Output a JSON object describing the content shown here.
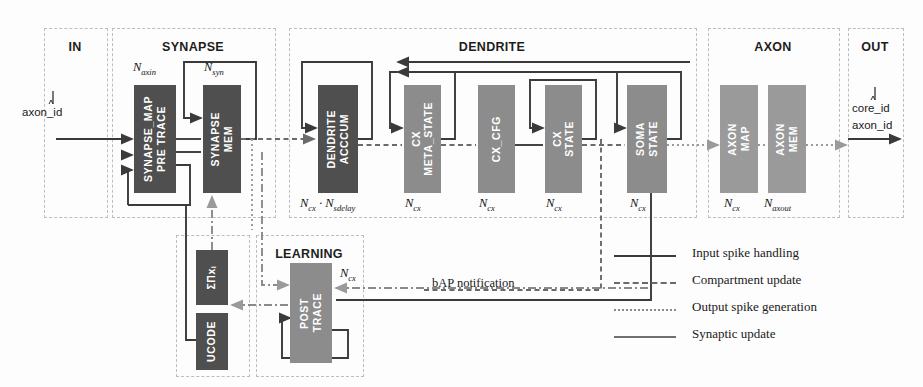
{
  "diagram": {
    "groups": [
      {
        "id": "in",
        "label": "IN",
        "x": 44,
        "y": 28,
        "w": 62,
        "h": 188
      },
      {
        "id": "synapse",
        "label": "SYNAPSE",
        "x": 112,
        "y": 28,
        "w": 162,
        "h": 188
      },
      {
        "id": "dendrite",
        "label": "DENDRITE",
        "x": 289,
        "y": 28,
        "w": 406,
        "h": 188
      },
      {
        "id": "axon",
        "label": "AXON",
        "x": 708,
        "y": 28,
        "w": 130,
        "h": 188
      },
      {
        "id": "out",
        "label": "OUT",
        "x": 848,
        "y": 28,
        "w": 54,
        "h": 188
      },
      {
        "id": "learnbox",
        "label": "",
        "x": 176,
        "y": 235,
        "w": 72,
        "h": 140
      },
      {
        "id": "learning",
        "label": "LEARNING",
        "x": 256,
        "y": 235,
        "w": 106,
        "h": 140
      }
    ],
    "blocks": [
      {
        "id": "synapse-map-pre-trace",
        "lines": [
          "SYNAPSE_MAP",
          "PRE TRACE"
        ],
        "shade": "dark",
        "x": 134,
        "y": 85,
        "w": 42,
        "h": 108,
        "caption": "N",
        "caption_sub": "axin",
        "caption_x": 133,
        "caption_y": 66
      },
      {
        "id": "synapse-mem",
        "lines": [
          "SYNAPSE",
          "MEM"
        ],
        "shade": "dark",
        "x": 203,
        "y": 85,
        "w": 38,
        "h": 108,
        "caption": "N",
        "caption_sub": "syn",
        "caption_x": 203,
        "caption_y": 66
      },
      {
        "id": "dendrite-acccum",
        "lines": [
          "DENDRITE",
          "ACCCUM"
        ],
        "shade": "dark",
        "x": 318,
        "y": 85,
        "w": 40,
        "h": 108,
        "caption": "N",
        "caption_sub": "cx",
        "caption_x": 303,
        "caption_y": 196,
        "caption2": "N",
        "caption2_sub": "sdelay",
        "caption_dot": " · "
      },
      {
        "id": "cx-meta-state",
        "lines": [
          "CX",
          "META_STATE"
        ],
        "shade": "mid",
        "x": 404,
        "y": 85,
        "w": 37,
        "h": 108,
        "caption": "N",
        "caption_sub": "cx",
        "caption_x": 404,
        "caption_y": 196
      },
      {
        "id": "cx-cfg",
        "lines": [
          "CX_CFG"
        ],
        "shade": "mid",
        "x": 478,
        "y": 85,
        "w": 37,
        "h": 108,
        "caption": "N",
        "caption_sub": "cx",
        "caption_x": 478,
        "caption_y": 196
      },
      {
        "id": "cx-state",
        "lines": [
          "CX",
          "STATE"
        ],
        "shade": "mid",
        "x": 545,
        "y": 85,
        "w": 37,
        "h": 108,
        "caption": "N",
        "caption_sub": "cx",
        "caption_x": 545,
        "caption_y": 196
      },
      {
        "id": "soma-state",
        "lines": [
          "SOMA",
          "STATE"
        ],
        "shade": "mid",
        "x": 627,
        "y": 85,
        "w": 40,
        "h": 108,
        "caption": "N",
        "caption_sub": "cx",
        "caption_x": 628,
        "caption_y": 196
      },
      {
        "id": "axon-map",
        "lines": [
          "AXON",
          "MAP"
        ],
        "shade": "lite",
        "x": 720,
        "y": 85,
        "w": 38,
        "h": 108,
        "caption": "N",
        "caption_sub": "cx",
        "caption_x": 722,
        "caption_y": 196
      },
      {
        "id": "axon-mem",
        "lines": [
          "AXON",
          "MEM"
        ],
        "shade": "lite",
        "x": 768,
        "y": 85,
        "w": 38,
        "h": 108,
        "caption": "N",
        "caption_sub": "axout",
        "caption_x": 764,
        "caption_y": 196
      },
      {
        "id": "sum-prod",
        "lines": [
          "ΣΠxᵢ"
        ],
        "shade": "dark",
        "x": 196,
        "y": 250,
        "w": 32,
        "h": 55
      },
      {
        "id": "ucode",
        "lines": [
          "UCODE"
        ],
        "shade": "dark",
        "x": 196,
        "y": 313,
        "w": 32,
        "h": 57
      },
      {
        "id": "post-trace",
        "lines": [
          "POST",
          "TRACE"
        ],
        "shade": "mid",
        "x": 290,
        "y": 263,
        "w": 42,
        "h": 100,
        "caption": "N",
        "caption_sub": "cx",
        "caption_x": 340,
        "caption_y": 268
      }
    ],
    "texts": [
      {
        "id": "input-signal-label",
        "value": "axon_id",
        "x": 22,
        "y": 110,
        "style": "mono"
      },
      {
        "id": "output-core-label",
        "value": "core_id",
        "x": 852,
        "y": 106,
        "style": "mono"
      },
      {
        "id": "output-axon-label",
        "value": "axon_id",
        "x": 852,
        "y": 122,
        "style": "mono"
      },
      {
        "id": "bap-notification",
        "value": "bAP notification",
        "x": 432,
        "y": 278,
        "style": "txt"
      }
    ],
    "legend": {
      "entries": [
        {
          "id": "input-spike-handling",
          "label": "Input spike handling",
          "style": "s-solid"
        },
        {
          "id": "compartment-update",
          "label": "Compartment update",
          "style": "s-dashed"
        },
        {
          "id": "output-spike-generation",
          "label": "Output spike generation",
          "style": "s-dotted"
        },
        {
          "id": "synaptic-update",
          "label": "Synaptic update",
          "style": "s-dashdot"
        }
      ]
    },
    "colors": {
      "block_dark": "#4f4f4f",
      "block_mid": "#8c8c8c",
      "block_light": "#9a9a9a",
      "group_border": "#bdbdbd",
      "wire_solid": "#3a3a3a",
      "wire_dashed": "#6a6a6a",
      "wire_dotted": "#9a9a9a",
      "background": "#fdfdfd"
    }
  }
}
